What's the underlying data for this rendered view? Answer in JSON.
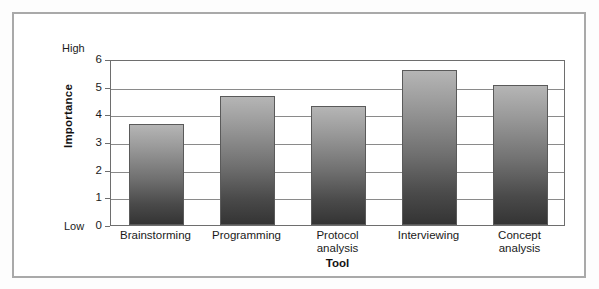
{
  "chart_data": {
    "type": "bar",
    "title": "",
    "xlabel": "Tool",
    "ylabel": "Importance",
    "categories": [
      "Brainstorming",
      "Programming",
      "Protocol analysis",
      "Interviewing",
      "Concept analysis"
    ],
    "category_lines": [
      [
        "Brainstorming"
      ],
      [
        "Programming"
      ],
      [
        "Protocol",
        "analysis"
      ],
      [
        "Interviewing"
      ],
      [
        "Concept",
        "analysis"
      ]
    ],
    "values": [
      3.65,
      4.65,
      4.3,
      5.6,
      5.05
    ],
    "ylim": [
      0,
      6
    ],
    "yticks": [
      6,
      5,
      4,
      3,
      2,
      1,
      0
    ],
    "ytick_labels": [
      "6",
      "5",
      "4",
      "3",
      "2",
      "1",
      "0"
    ],
    "y_axis_endpoints": {
      "high": "High",
      "low": "Low"
    },
    "grid": true,
    "legend": null,
    "series": [
      {
        "name": "Importance",
        "values": [
          3.65,
          4.65,
          4.3,
          5.6,
          5.05
        ]
      }
    ],
    "colors": {
      "bar_top": "#b5b5b5",
      "bar_bottom": "#343434",
      "gridline": "#8a8a8a",
      "axis": "#6e6e6e",
      "frame": "#a9a9a9",
      "text": "#1a1a1a",
      "background": "#ffffff"
    }
  }
}
